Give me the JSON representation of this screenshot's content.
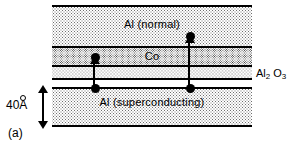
{
  "figure": {
    "panel_label": "(a)",
    "scale": {
      "value": "40",
      "unit": "A",
      "unit_display": "Å",
      "label": "40Å",
      "icon": "double-headed-vertical-arrow"
    },
    "layers": [
      {
        "id": "al-normal",
        "label": "Al (normal)",
        "fill": "light-stipple"
      },
      {
        "id": "cobalt",
        "label": "Co",
        "fill": "dark-stipple"
      },
      {
        "id": "aluminium-oxide",
        "label": "Al2O3",
        "fill": "thin-stipple"
      },
      {
        "id": "al-superconducting",
        "label": "Al (superconducting)",
        "fill": "light-stipple"
      }
    ],
    "callout": {
      "element": "Al",
      "sub1": "2",
      "element2": "O",
      "sub2": "3"
    },
    "arrows": [
      {
        "id": "tunneling-arrow-left",
        "direction": "up",
        "from_layer": "aluminium-oxide",
        "to_layer": "cobalt"
      },
      {
        "id": "tunneling-arrow-right",
        "direction": "up",
        "from_layer": "aluminium-oxide",
        "to_layer": "al-normal"
      }
    ],
    "colors": {
      "ink": "#000000",
      "background": "#ffffff"
    }
  }
}
